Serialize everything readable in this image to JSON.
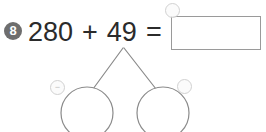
{
  "problem": {
    "number": "8",
    "number_badge_color": "#6e6e6e",
    "equation": {
      "first_addend": "280",
      "operator": "+",
      "second_addend": "49",
      "equals": "="
    },
    "answer_box": {
      "value": "",
      "placeholder": "",
      "border_color": "#9a9a9a"
    }
  },
  "number_bond": {
    "apex_label": "",
    "left_part_value": "",
    "right_part_value": "",
    "stroke_color": "#8a8a8a"
  },
  "markers": {
    "answer_box_marker": "stamp-circle-icon",
    "left_circle_marker": "minus-circle-icon",
    "right_circle_marker": "stamp-circle-icon",
    "answer_box_glyph": "",
    "left_circle_glyph": "−",
    "right_circle_glyph": ""
  },
  "colors": {
    "background": "#ffffff",
    "text": "#2b2b2b",
    "diagram_stroke": "#8a8a8a"
  }
}
